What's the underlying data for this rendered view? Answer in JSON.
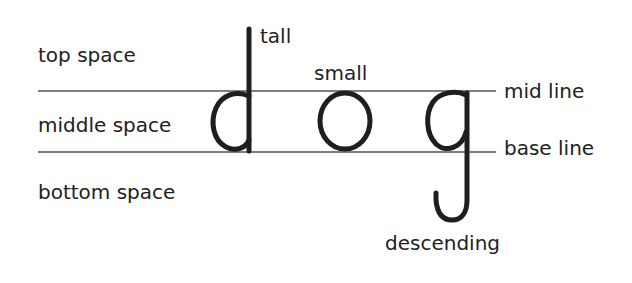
{
  "diagram": {
    "word": "dog",
    "letters": [
      {
        "char": "d",
        "category": "tall"
      },
      {
        "char": "o",
        "category": "small"
      },
      {
        "char": "g",
        "category": "descending"
      }
    ],
    "space_labels": {
      "top": "top space",
      "middle": "middle space",
      "bottom": "bottom space"
    },
    "line_labels": {
      "mid": "mid line",
      "base": "base line"
    },
    "letter_labels": {
      "tall": "tall",
      "small": "small",
      "descending": "descending"
    },
    "colors": {
      "ink": "#1e1e1e",
      "line": "#555555",
      "background": "#ffffff"
    }
  }
}
